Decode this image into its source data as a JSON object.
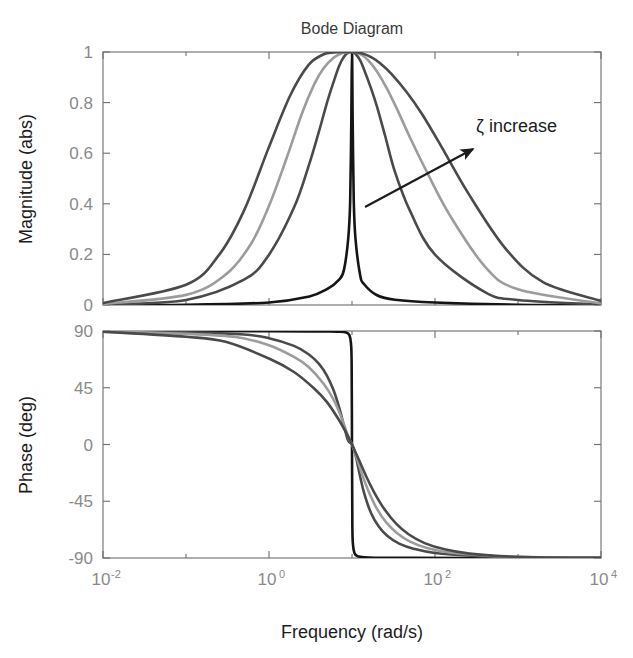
{
  "figure": {
    "title": "Bode Diagram",
    "width": 633,
    "height": 658,
    "background": "#ffffff"
  },
  "annotation": {
    "text": "ζ increase",
    "arrow_from": [
      365,
      207
    ],
    "arrow_to": [
      477,
      147
    ],
    "color": "#1c1c1c"
  },
  "axes": {
    "xlabel": "Frequency  (rad/s)",
    "xtick_labels": [
      "10",
      "10",
      "10",
      "10"
    ],
    "xtick_exponents": [
      "-2",
      "0",
      "2",
      "4"
    ],
    "magnitude_ylabel": "Magnitude (abs)",
    "magnitude_yticks": [
      "1",
      "0.8",
      "0.6",
      "0.4",
      "0.2",
      "0"
    ],
    "phase_ylabel": "Phase (deg)",
    "phase_yticks": [
      "90",
      "45",
      "0",
      "-45",
      "-90"
    ]
  },
  "chart_data": {
    "type": "line",
    "title": "Bode Diagram",
    "subtitle": "",
    "xlabel": "Frequency  (rad/s)",
    "xscale": "log",
    "xlim": [
      0.01,
      10000
    ],
    "xticks": [
      0.01,
      1,
      100,
      10000
    ],
    "xtick_labels": [
      "10^-2",
      "10^0",
      "10^2",
      "10^4"
    ],
    "grid": false,
    "legend": null,
    "annotations": [
      {
        "text": "ζ increase",
        "x": 1200,
        "y": 0.78,
        "arrow_from_x": 55,
        "arrow_from_y": 0.4,
        "arrow_to_x": 700,
        "arrow_to_y": 0.66
      }
    ],
    "system": {
      "description": "Band-pass second-order resonance, natural frequency wn = 10 rad/s, varying damping ratio zeta",
      "wn": 10,
      "zeta_values": [
        0.005,
        0.1,
        0.2,
        0.4
      ],
      "transfer_function": "H(s) = 2*zeta*wn*s / (s^2 + 2*zeta*wn*s + wn^2)"
    },
    "subplots": [
      {
        "name": "magnitude",
        "ylabel": "Magnitude (abs)",
        "ylim": [
          0,
          1
        ],
        "yticks": [
          0,
          0.2,
          0.4,
          0.6,
          0.8,
          1
        ],
        "ytick_labels": [
          "0",
          "0.2",
          "0.4",
          "0.6",
          "0.8",
          "1"
        ],
        "series": [
          {
            "name": "zeta = 0.005",
            "zeta": 0.005,
            "color": "#151515",
            "width": 2.6,
            "x": [
              0.01,
              0.1,
              1,
              3,
              5,
              7,
              8,
              9,
              9.5,
              9.8,
              10,
              10.2,
              10.5,
              11,
              12.5,
              14,
              20,
              33,
              100,
              1000,
              10000
            ],
            "y": [
              0.0001,
              0.001,
              0.0101,
              0.033,
              0.0625,
              0.1007,
              0.1389,
              0.2618,
              0.4082,
              0.7143,
              1.0,
              0.7168,
              0.4124,
              0.2646,
              0.1202,
              0.082,
              0.0385,
              0.021,
              0.0101,
              0.001,
              0.0001
            ]
          },
          {
            "name": "zeta = 0.1",
            "zeta": 0.1,
            "color": "#4a4a4a",
            "width": 2.6,
            "x": [
              0.01,
              0.1,
              0.5,
              1,
              2,
              3,
              4,
              5,
              6,
              7,
              8,
              9,
              10,
              11,
              12.5,
              14,
              17,
              20,
              25,
              33,
              50,
              100,
              400,
              1000,
              10000
            ],
            "y": [
              0.002,
              0.02,
              0.1,
              0.199,
              0.385,
              0.549,
              0.686,
              0.8,
              0.882,
              0.945,
              0.981,
              0.998,
              1.0,
              0.993,
              0.968,
              0.93,
              0.855,
              0.784,
              0.67,
              0.525,
              0.372,
              0.199,
              0.051,
              0.02,
              0.002
            ]
          },
          {
            "name": "zeta = 0.2",
            "zeta": 0.2,
            "color": "#9c9c9c",
            "width": 2.6,
            "x": [
              0.01,
              0.1,
              0.3,
              0.6,
              1,
              1.6,
              2.5,
              3.5,
              4.5,
              6,
              7.5,
              9,
              10,
              11.5,
              13.5,
              16,
              20,
              26,
              35,
              50,
              80,
              150,
              400,
              1000,
              10000
            ],
            "y": [
              0.004,
              0.04,
              0.12,
              0.239,
              0.392,
              0.573,
              0.758,
              0.872,
              0.934,
              0.977,
              0.995,
              0.999,
              1.0,
              0.997,
              0.986,
              0.964,
              0.923,
              0.859,
              0.773,
              0.662,
              0.525,
              0.356,
              0.152,
              0.062,
              0.006
            ]
          },
          {
            "name": "zeta = 0.4",
            "zeta": 0.4,
            "color": "#4a4a4a",
            "width": 2.6,
            "x": [
              0.01,
              0.1,
              0.25,
              0.5,
              1,
              1.8,
              3,
              4.5,
              6,
              8,
              10,
              13,
              17,
              22,
              30,
              45,
              70,
              120,
              250,
              700,
              2000,
              10000
            ],
            "y": [
              0.008,
              0.08,
              0.198,
              0.373,
              0.625,
              0.828,
              0.949,
              0.99,
              0.998,
              1.0,
              1.0,
              0.995,
              0.98,
              0.955,
              0.913,
              0.844,
              0.754,
              0.625,
              0.443,
              0.225,
              0.09,
              0.016
            ]
          }
        ]
      },
      {
        "name": "phase",
        "ylabel": "Phase (deg)",
        "ylim": [
          -90,
          90
        ],
        "yticks": [
          90,
          45,
          0,
          -45,
          -90
        ],
        "ytick_labels": [
          "90",
          "45",
          "0",
          "-45",
          "-90"
        ],
        "series": [
          {
            "name": "zeta = 0.005",
            "zeta": 0.005,
            "color": "#151515",
            "width": 2.6,
            "x": [
              0.01,
              0.1,
              1,
              3,
              5,
              7,
              8.5,
              9.3,
              9.7,
              9.9,
              10,
              10.1,
              10.3,
              10.7,
              11.5,
              13,
              16,
              25,
              60,
              300,
              2000,
              10000
            ],
            "y": [
              90,
              90,
              89.9,
              89.7,
              89.6,
              89.4,
              88.8,
              86.7,
              80.5,
              65.0,
              0,
              -65.0,
              -80.0,
              -86.0,
              -88.4,
              -89.2,
              -89.6,
              -89.8,
              -89.9,
              -90,
              -90,
              -90
            ]
          },
          {
            "name": "zeta = 0.1",
            "zeta": 0.1,
            "color": "#4a4a4a",
            "width": 2.6,
            "x": [
              0.01,
              0.1,
              0.5,
              1,
              2,
              3,
              4,
              5,
              6,
              7,
              8,
              9,
              10,
              11,
              12.5,
              14,
              17,
              21,
              27,
              37,
              55,
              100,
              300,
              1000,
              10000
            ],
            "y": [
              89.9,
              88.9,
              87.2,
              84.3,
              78.2,
              71.6,
              63.9,
              54.5,
              43.0,
              29.4,
              14.9,
              2.9,
              0,
              -8.0,
              -25.0,
              -38.5,
              -54.5,
              -65.0,
              -72.8,
              -78.6,
              -82.6,
              -86.0,
              -88.3,
              -89.4,
              -89.9
            ]
          },
          {
            "name": "zeta = 0.2",
            "zeta": 0.2,
            "color": "#9c9c9c",
            "width": 2.6,
            "x": [
              0.01,
              0.1,
              0.4,
              1,
              2,
              3,
              4.5,
              6,
              7.5,
              9,
              10,
              11.5,
              13.5,
              16,
              20,
              26,
              35,
              50,
              80,
              150,
              400,
              1200,
              10000
            ],
            "y": [
              89.8,
              87.7,
              85.2,
              78.7,
              69.4,
              61.4,
              48.6,
              35.6,
              21.0,
              6.2,
              0,
              -11.5,
              -25.3,
              -37.8,
              -51.0,
              -62.0,
              -70.4,
              -77.0,
              -82.0,
              -85.7,
              -88.0,
              -89.3,
              -89.8
            ]
          },
          {
            "name": "zeta = 0.4",
            "zeta": 0.4,
            "color": "#4a4a4a",
            "width": 2.6,
            "x": [
              0.01,
              0.1,
              0.3,
              1,
              2,
              3.5,
              5,
              7,
              9,
              10,
              12,
              15,
              19,
              25,
              34,
              48,
              75,
              130,
              260,
              700,
              2500,
              10000
            ],
            "y": [
              89.5,
              85.4,
              81.4,
              68.2,
              57.5,
              44.4,
              33.6,
              19.2,
              6.3,
              0,
              -11.5,
              -26.0,
              -39.3,
              -52.0,
              -62.8,
              -71.2,
              -78.2,
              -83.1,
              -86.5,
              -88.7,
              -89.6,
              -89.9
            ]
          }
        ]
      }
    ]
  },
  "geometry": {
    "mag_plot": {
      "left": 103,
      "top": 52,
      "right": 601,
      "bottom": 305
    },
    "phase_plot": {
      "left": 103,
      "top": 331,
      "right": 601,
      "bottom": 558
    }
  }
}
